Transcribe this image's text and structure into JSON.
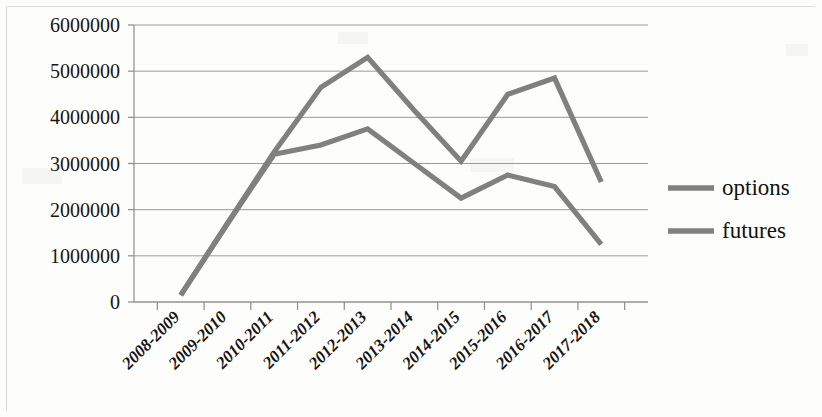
{
  "chart_data": {
    "type": "line",
    "title": "",
    "xlabel": "",
    "ylabel": "",
    "categories": [
      "2008-2009",
      "2009-2010",
      "2010-2011",
      "2011-2012",
      "2012-2013",
      "2013-2014",
      "2014-2015",
      "2015-2016",
      "2016-2017",
      "2017-2018"
    ],
    "series": [
      {
        "name": "options",
        "color": "#808080",
        "values": [
          150000,
          1700000,
          3250000,
          4650000,
          5300000,
          4150000,
          3050000,
          4500000,
          4850000,
          2600000
        ]
      },
      {
        "name": "futures",
        "color": "#808080",
        "values": [
          150000,
          1700000,
          3200000,
          3400000,
          3750000,
          3000000,
          2250000,
          2750000,
          2500000,
          1250000
        ]
      }
    ],
    "ylim": [
      0,
      6000000
    ],
    "ytick_labels": [
      "0",
      "1000000",
      "2000000",
      "3000000",
      "4000000",
      "5000000",
      "6000000"
    ],
    "ytick_values": [
      0,
      1000000,
      2000000,
      3000000,
      4000000,
      5000000,
      6000000
    ],
    "grid": true,
    "legend_position": "right",
    "legend_entries": [
      {
        "label": "options",
        "color": "#808080"
      },
      {
        "label": "futures",
        "color": "#808080"
      }
    ]
  },
  "axes": {
    "x_label_rotation": -45
  },
  "colors": {
    "line": "#808080",
    "grid": "#9a9a9a",
    "axis": "#8d8d8d",
    "text": "#141414",
    "background": "#fdfdfc"
  }
}
